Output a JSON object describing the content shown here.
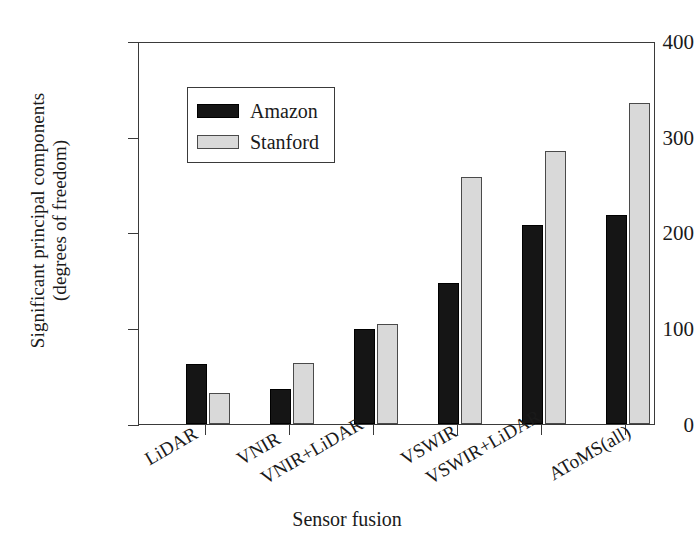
{
  "chart_data": {
    "type": "bar",
    "title": "",
    "xlabel": "Sensor fusion",
    "ylabel_line1": "Significant principal components",
    "ylabel_line2": "(degrees of freedom)",
    "categories": [
      "LiDAR",
      "VNIR",
      "VNIR+LiDAR",
      "VSWIR",
      "VSWIR+LiDAR",
      "AToMS(all)"
    ],
    "series": [
      {
        "name": "Amazon",
        "color": "#151515",
        "values": [
          63,
          37,
          99,
          147,
          208,
          218
        ]
      },
      {
        "name": "Stanford",
        "color": "#d9d9d9",
        "values": [
          32,
          64,
          104,
          258,
          285,
          335
        ]
      }
    ],
    "ylim": [
      0,
      400
    ],
    "yticks": [
      0,
      100,
      200,
      300,
      400
    ],
    "ytick_labels": [
      "0",
      "100",
      "200",
      "300",
      "400"
    ],
    "grid": false,
    "legend_position": "upper-left-inside",
    "xtick_label_rotation": -30
  },
  "legend": {
    "entries": [
      {
        "label": "Amazon",
        "swatch": "amazon"
      },
      {
        "label": "Stanford",
        "swatch": "stanford"
      }
    ]
  }
}
